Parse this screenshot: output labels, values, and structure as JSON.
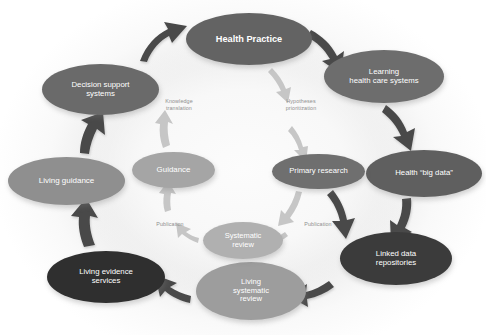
{
  "figure": {
    "palette": {
      "outer_node_dark": "#3a3a3a",
      "outer_node_mid": "#6e6e6e",
      "inner_node_light": "#a8a8a8",
      "inner_node_lighter": "#bdbdbd",
      "outer_arrow": "#4a4a4a",
      "inner_arrow": "#c2c2c2",
      "link_label_text": "#8f8f8f",
      "node_text": "#ffffff",
      "background": "#ffffff",
      "halo": "#ececec"
    }
  },
  "nodes": [
    {
      "id": "health-practice",
      "label": "Health Practice",
      "ring": "outer",
      "bold": true,
      "color": "#636363",
      "font_size": 9.2,
      "x": 186,
      "y": 13,
      "w": 126,
      "h": 52
    },
    {
      "id": "learning-health-care-systems",
      "label": "Learning\nhealth care systems",
      "ring": "outer",
      "bold": false,
      "color": "#6d6d6d",
      "font_size": 7.8,
      "x": 324,
      "y": 50,
      "w": 120,
      "h": 53
    },
    {
      "id": "health-big-data",
      "label": "Health “big data”",
      "ring": "outer",
      "bold": false,
      "color": "#5f5f5f",
      "font_size": 7.8,
      "x": 366,
      "y": 150,
      "w": 116,
      "h": 47
    },
    {
      "id": "linked-data-repositories",
      "label": "Linked data\nrepositories",
      "ring": "outer",
      "bold": false,
      "color": "#3b3b3b",
      "font_size": 7.8,
      "x": 340,
      "y": 232,
      "w": 112,
      "h": 53
    },
    {
      "id": "living-systematic-review",
      "label": "Living\nsystematic\nreview",
      "ring": "outer",
      "bold": false,
      "color": "#9d9d9d",
      "font_size": 7.6,
      "x": 196,
      "y": 262,
      "w": 110,
      "h": 58
    },
    {
      "id": "living-evidence-services",
      "label": "Living evidence\nservices",
      "ring": "outer",
      "bold": false,
      "color": "#2f2f2f",
      "font_size": 7.8,
      "x": 47,
      "y": 251,
      "w": 118,
      "h": 52
    },
    {
      "id": "living-guidance",
      "label": "Living guidance",
      "ring": "outer",
      "bold": false,
      "color": "#8f8f8f",
      "font_size": 8.0,
      "x": 8,
      "y": 157,
      "w": 117,
      "h": 48
    },
    {
      "id": "decision-support-systems",
      "label": "Decision support\nsystems",
      "ring": "outer",
      "bold": false,
      "color": "#6a6a6a",
      "font_size": 7.8,
      "x": 42,
      "y": 64,
      "w": 117,
      "h": 51
    },
    {
      "id": "guidance",
      "label": "Guidance",
      "ring": "inner",
      "bold": false,
      "color": "#a5a5a5",
      "font_size": 7.9,
      "x": 132,
      "y": 152,
      "w": 83,
      "h": 36
    },
    {
      "id": "systematic-review",
      "label": "Systematic\nreview",
      "ring": "inner",
      "bold": false,
      "color": "#b0b0b0",
      "font_size": 7.5,
      "x": 203,
      "y": 222,
      "w": 80,
      "h": 37
    },
    {
      "id": "primary-research",
      "label": "Primary research",
      "ring": "inner",
      "bold": false,
      "color": "#6f6f6f",
      "font_size": 7.7,
      "x": 272,
      "y": 154,
      "w": 93,
      "h": 35
    }
  ],
  "link_labels": [
    {
      "id": "knowledge-translation",
      "text": "Knowledge\ntranslation",
      "x": 150,
      "y": 98,
      "w": 58
    },
    {
      "id": "hypotheses-prioritization",
      "text": "Hypotheses\nprioritization",
      "x": 272,
      "y": 98,
      "w": 58
    },
    {
      "id": "publication-left",
      "text": "Publication",
      "x": 145,
      "y": 221,
      "w": 50
    },
    {
      "id": "publication-right",
      "text": "Publication",
      "x": 293,
      "y": 221,
      "w": 50
    }
  ],
  "arrows": {
    "outer": [
      {
        "id": "arrow-decision-support-to-health-practice"
      },
      {
        "id": "arrow-health-practice-to-learning-health-care-systems"
      },
      {
        "id": "arrow-learning-health-care-systems-to-health-big-data"
      },
      {
        "id": "arrow-health-big-data-to-linked-data-repositories"
      },
      {
        "id": "arrow-linked-data-repositories-to-living-systematic-review"
      },
      {
        "id": "arrow-living-systematic-review-to-living-evidence-services"
      },
      {
        "id": "arrow-living-evidence-services-to-living-guidance"
      },
      {
        "id": "arrow-living-guidance-to-decision-support-systems"
      }
    ],
    "inner": [
      {
        "id": "arrow-guidance-to-knowledge-translation"
      },
      {
        "id": "arrow-hypotheses-prioritization-to-primary-research"
      },
      {
        "id": "arrow-primary-research-to-publication-right"
      },
      {
        "id": "arrow-systematic-review-to-publication-left"
      },
      {
        "id": "arrow-publication-left-to-guidance"
      }
    ]
  }
}
